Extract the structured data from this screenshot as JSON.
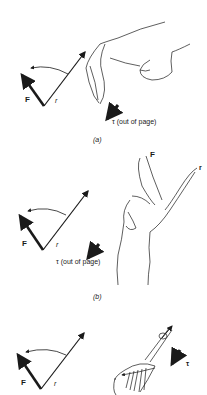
{
  "panels": [
    {
      "id": "a",
      "caption": "(a)",
      "vectors": {
        "force": "F",
        "radius": "r"
      },
      "torque_label": "τ (out of page)",
      "illustration": "curled right hand"
    },
    {
      "id": "b",
      "caption": "(b)",
      "vectors": {
        "force": "F",
        "radius": "r"
      },
      "finger_labels": {
        "index": "F",
        "middle": "r"
      },
      "torque_label": "τ (out of page)",
      "illustration": "right hand with two fingers extended"
    },
    {
      "id": "c",
      "vectors": {
        "force": "F",
        "radius": "r"
      },
      "torque_label": "τ",
      "illustration": "screwdriver turning"
    }
  ],
  "colors": {
    "ink": "#1a1a1a",
    "background": "#ffffff"
  }
}
